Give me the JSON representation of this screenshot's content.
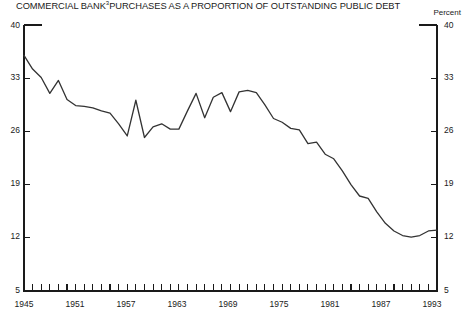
{
  "title": {
    "text_before": "COMMERCIAL BANK",
    "superscript": "3",
    "text_after": "PURCHASES AS A PROPORTION OF OUTSTANDING PUBLIC DEBT",
    "full": "COMMERCIAL BANK3PURCHASES AS A PROPORTION OF OUTSTANDING PUBLIC DEBT"
  },
  "unit_label": "Percent",
  "footnote": "",
  "axes": {
    "y_ticks": [
      "5",
      "12",
      "19",
      "26",
      "33",
      "40"
    ],
    "y_ticks_right": [
      "5",
      "12",
      "19",
      "26",
      "33",
      "40"
    ],
    "x_ticks": [
      "1945",
      "1951",
      "1957",
      "1963",
      "1969",
      "1975",
      "1981",
      "1987",
      "1993"
    ]
  },
  "chart_data": {
    "type": "line",
    "title": "COMMERCIAL BANK3PURCHASES AS A PROPORTION OF OUTSTANDING PUBLIC DEBT",
    "xlabel": "",
    "ylabel": "Percent",
    "xlim": [
      1945,
      1993
    ],
    "ylim": [
      5,
      40
    ],
    "yticks": [
      5,
      12,
      19,
      26,
      33,
      40
    ],
    "xticks": [
      1945,
      1951,
      1957,
      1963,
      1969,
      1975,
      1981,
      1987,
      1993
    ],
    "xtick_minor_step": 1,
    "grid": false,
    "legend": null,
    "line_color": "#333333",
    "x": [
      1945,
      1946,
      1947,
      1948,
      1949,
      1950,
      1951,
      1952,
      1953,
      1954,
      1955,
      1956,
      1957,
      1958,
      1959,
      1960,
      1961,
      1962,
      1963,
      1964,
      1965,
      1966,
      1967,
      1968,
      1969,
      1970,
      1971,
      1972,
      1973,
      1974,
      1975,
      1976,
      1977,
      1978,
      1979,
      1980,
      1981,
      1982,
      1983,
      1984,
      1985,
      1986,
      1987,
      1988,
      1989,
      1990,
      1991,
      1992,
      1993
    ],
    "values": [
      36.0,
      34.2,
      33.1,
      31.0,
      32.7,
      30.2,
      29.4,
      29.3,
      29.1,
      28.7,
      28.4,
      27.0,
      25.4,
      30.1,
      25.2,
      26.6,
      27.0,
      26.3,
      26.3,
      28.7,
      31.0,
      27.8,
      30.5,
      31.1,
      28.6,
      31.2,
      31.4,
      31.1,
      29.5,
      27.7,
      27.2,
      26.4,
      26.2,
      24.4,
      24.6,
      23.0,
      22.4,
      20.8,
      19.0,
      17.5,
      17.2,
      15.4,
      13.9,
      12.9,
      12.3,
      12.1,
      12.3,
      12.9,
      13.0
    ],
    "series": [
      {
        "name": "Commercial bank purchases as a proportion of outstanding public debt",
        "values": [
          36.0,
          34.2,
          33.1,
          31.0,
          32.7,
          30.2,
          29.4,
          29.3,
          29.1,
          28.7,
          28.4,
          27.0,
          25.4,
          30.1,
          25.2,
          26.6,
          27.0,
          26.3,
          26.3,
          28.7,
          31.0,
          27.8,
          30.5,
          31.1,
          28.6,
          31.2,
          31.4,
          31.1,
          29.5,
          27.7,
          27.2,
          26.4,
          26.2,
          24.4,
          24.6,
          23.0,
          22.4,
          20.8,
          19.0,
          17.5,
          17.2,
          15.4,
          13.9,
          12.9,
          12.3,
          12.1,
          12.3,
          12.9,
          13.0
        ]
      }
    ]
  }
}
